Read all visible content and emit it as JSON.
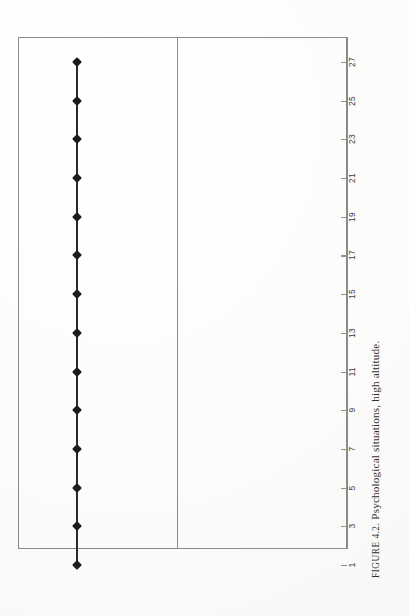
{
  "figure": {
    "caption_lead": "FIGURE 4.2.",
    "caption_text": "Psychological situations, high altitude.",
    "caption_full": "FIGURE 4.2. Psychological situations, high altitude.",
    "orientation": "rotated-90-ccw",
    "page_background": "#fdfdfd",
    "frame_color": "#8a8a8a",
    "series_color": "#1c1c1c"
  },
  "chart_data": {
    "type": "line",
    "title": "Psychological situations, high altitude.",
    "xlabel": "",
    "ylabel": "",
    "grid": false,
    "legend": "none",
    "marker": "diamond",
    "orientation": "rotated-90-ccw",
    "axis_position": "right-rotated",
    "xlim": [
      1,
      27
    ],
    "ylim": [
      0,
      1
    ],
    "categories": [
      1,
      3,
      5,
      7,
      9,
      11,
      13,
      15,
      17,
      19,
      21,
      23,
      25,
      27
    ],
    "tick_labels": [
      "1",
      "3",
      "5",
      "7",
      "9",
      "11",
      "13",
      "15",
      "17",
      "19",
      "21",
      "23",
      "25",
      "27"
    ],
    "series": [
      {
        "name": "Psychological situations",
        "x": [
          1,
          3,
          5,
          7,
          9,
          11,
          13,
          15,
          17,
          19,
          21,
          23,
          25,
          27
        ],
        "values": [
          1,
          1,
          1,
          1,
          1,
          1,
          1,
          1,
          1,
          1,
          1,
          1,
          1,
          1
        ]
      }
    ]
  },
  "panels": {
    "divider_present": true,
    "count": 2
  }
}
